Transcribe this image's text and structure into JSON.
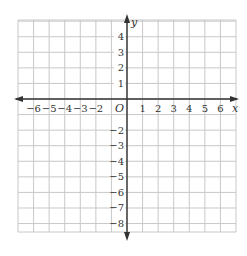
{
  "diagram": {
    "type": "coordinate-plane",
    "x_range": [
      -7,
      7
    ],
    "y_range": [
      -8.7,
      5
    ],
    "x_axis_label": "x",
    "y_axis_label": "y",
    "origin_label": "O",
    "x_tick_labels": [
      "−6",
      "−5",
      "−4",
      "−3",
      "−2",
      "1",
      "2",
      "3",
      "4",
      "5",
      "6"
    ],
    "x_tick_values": [
      -6,
      -5,
      -4,
      -3,
      -2,
      1,
      2,
      3,
      4,
      5,
      6
    ],
    "y_tick_labels": [
      "4",
      "3",
      "2",
      "1",
      "−2",
      "−3",
      "−4",
      "−5",
      "−6",
      "−7",
      "−8"
    ],
    "y_tick_values": [
      4,
      3,
      2,
      1,
      -2,
      -3,
      -4,
      -5,
      -6,
      -7,
      -8
    ],
    "colors": {
      "grid": "#c8c8c8",
      "axis": "#333333",
      "text": "#333333",
      "background": "#ffffff"
    }
  }
}
